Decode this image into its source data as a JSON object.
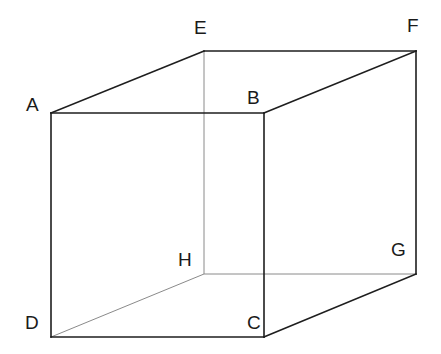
{
  "diagram": {
    "type": "cube-wireframe",
    "background": "#ffffff",
    "colors": {
      "visible_edge": "#1e1e1e",
      "hidden_edge": "#8a8a8a",
      "label": "#1a1a1a"
    },
    "vertices": {
      "A": {
        "label": "A",
        "x": 51,
        "y": 113,
        "label_x": 26,
        "label_y": 111
      },
      "B": {
        "label": "B",
        "x": 264,
        "y": 113,
        "label_x": 247,
        "label_y": 104
      },
      "C": {
        "label": "C",
        "x": 264,
        "y": 337,
        "label_x": 247,
        "label_y": 329
      },
      "D": {
        "label": "D",
        "x": 51,
        "y": 337,
        "label_x": 25,
        "label_y": 329
      },
      "E": {
        "label": "E",
        "x": 204,
        "y": 51,
        "label_x": 194,
        "label_y": 34
      },
      "F": {
        "label": "F",
        "x": 416,
        "y": 51,
        "label_x": 407,
        "label_y": 32
      },
      "G": {
        "label": "G",
        "x": 416,
        "y": 274,
        "label_x": 391,
        "label_y": 256
      },
      "H": {
        "label": "H",
        "x": 204,
        "y": 274,
        "label_x": 178,
        "label_y": 266
      }
    },
    "edges_visible": [
      [
        "A",
        "B"
      ],
      [
        "B",
        "C"
      ],
      [
        "C",
        "D"
      ],
      [
        "D",
        "A"
      ],
      [
        "A",
        "E"
      ],
      [
        "E",
        "F"
      ],
      [
        "F",
        "B"
      ],
      [
        "F",
        "G"
      ],
      [
        "G",
        "C"
      ]
    ],
    "edges_hidden": [
      [
        "E",
        "H"
      ],
      [
        "H",
        "D"
      ],
      [
        "H",
        "G"
      ]
    ]
  }
}
